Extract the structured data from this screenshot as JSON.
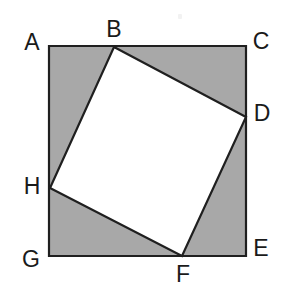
{
  "figure": {
    "canvas": {
      "width": 292,
      "height": 302
    },
    "colors": {
      "shaded_region": "#a8a8a8",
      "inner_square_fill": "#ffffff",
      "stroke": "#1f1f1f",
      "label_text": "#1a1a1a",
      "background": "#ffffff"
    },
    "outer_square": {
      "name": "ACEG",
      "stroke_width": 2.2,
      "points": [
        {
          "label": "A",
          "x": 49,
          "y": 46
        },
        {
          "label": "C",
          "x": 246,
          "y": 46
        },
        {
          "label": "E",
          "x": 246,
          "y": 256
        },
        {
          "label": "G",
          "x": 49,
          "y": 256
        }
      ]
    },
    "inner_square": {
      "name": "BDFH",
      "stroke_width": 2.2,
      "points": [
        {
          "label": "B",
          "x": 114,
          "y": 47
        },
        {
          "label": "D",
          "x": 246,
          "y": 117
        },
        {
          "label": "F",
          "x": 182,
          "y": 256
        },
        {
          "label": "H",
          "x": 50,
          "y": 188
        }
      ]
    },
    "labels": [
      {
        "text": "A",
        "x": 32,
        "y": 42
      },
      {
        "text": "B",
        "x": 114,
        "y": 29
      },
      {
        "text": "C",
        "x": 261,
        "y": 41
      },
      {
        "text": "D",
        "x": 262,
        "y": 113
      },
      {
        "text": "E",
        "x": 261,
        "y": 248
      },
      {
        "text": "F",
        "x": 183,
        "y": 274
      },
      {
        "text": "G",
        "x": 31,
        "y": 259
      },
      {
        "text": "H",
        "x": 32,
        "y": 186
      }
    ],
    "artifacts": [
      {
        "name": "scan-speck",
        "x": 178,
        "y": 14
      }
    ]
  }
}
